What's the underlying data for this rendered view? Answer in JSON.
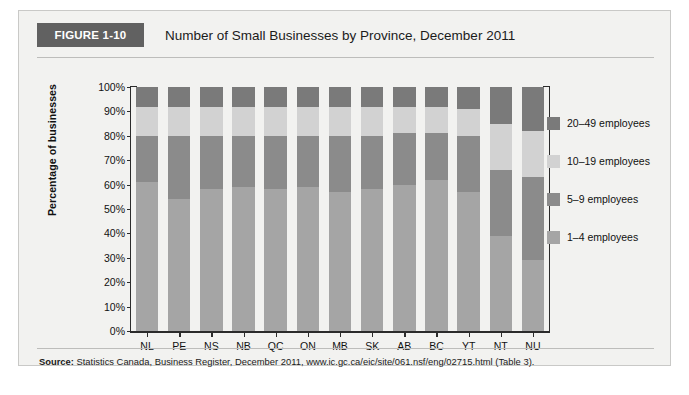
{
  "figure": {
    "badge": "FIGURE 1-10",
    "title": "Number of Small Businesses by Province, December 2011",
    "source_prefix": "Source:",
    "source_text": " Statistics Canada, Business Register, December 2011, www.ic.gc.ca/eic/site/061.nsf/eng/02715.html (Table 3)."
  },
  "colors": {
    "seg_1_4": "#a5a5a5",
    "seg_5_9": "#8b8b8b",
    "seg_10_19": "#d2d2d2",
    "seg_20_49": "#7a7a7a",
    "badge_bg": "#616161",
    "card_bg": "#f2f2f0",
    "axis": "#2b2b2b"
  },
  "chart_data": {
    "type": "bar",
    "subtype": "stacked-100-percent",
    "title": "Number of Small Businesses by Province, December 2011",
    "xlabel": "",
    "ylabel": "Percentage of businesses",
    "ylim": [
      0,
      100
    ],
    "yticks": [
      "0%",
      "10%",
      "20%",
      "30%",
      "40%",
      "50%",
      "60%",
      "70%",
      "80%",
      "90%",
      "100%"
    ],
    "ytick_values": [
      0,
      10,
      20,
      30,
      40,
      50,
      60,
      70,
      80,
      90,
      100
    ],
    "grid": false,
    "legend_position": "right",
    "categories": [
      "NL",
      "PE",
      "NS",
      "NB",
      "QC",
      "ON",
      "MB",
      "SK",
      "AB",
      "BC",
      "YT",
      "NT",
      "NU"
    ],
    "series": [
      {
        "name": "1–4 employees",
        "color": "#a5a5a5",
        "values": [
          61,
          54,
          58,
          59,
          58,
          59,
          57,
          58,
          60,
          62,
          57,
          39,
          29
        ]
      },
      {
        "name": "5–9 employees",
        "color": "#8b8b8b",
        "values": [
          19,
          26,
          22,
          21,
          22,
          21,
          23,
          22,
          21,
          19,
          23,
          27,
          34
        ]
      },
      {
        "name": "10–19 employees",
        "color": "#d2d2d2",
        "values": [
          12,
          12,
          12,
          12,
          12,
          12,
          12,
          12,
          11,
          11,
          11,
          19,
          19
        ]
      },
      {
        "name": "20–49 employees",
        "color": "#7a7a7a",
        "values": [
          8,
          8,
          8,
          8,
          8,
          8,
          8,
          8,
          8,
          8,
          9,
          15,
          18
        ]
      }
    ],
    "legend": [
      {
        "label": "20–49 employees",
        "color": "#7a7a7a"
      },
      {
        "label": "10–19 employees",
        "color": "#d2d2d2"
      },
      {
        "label": "5–9 employees",
        "color": "#8b8b8b"
      },
      {
        "label": "1–4 employees",
        "color": "#a5a5a5"
      }
    ]
  }
}
